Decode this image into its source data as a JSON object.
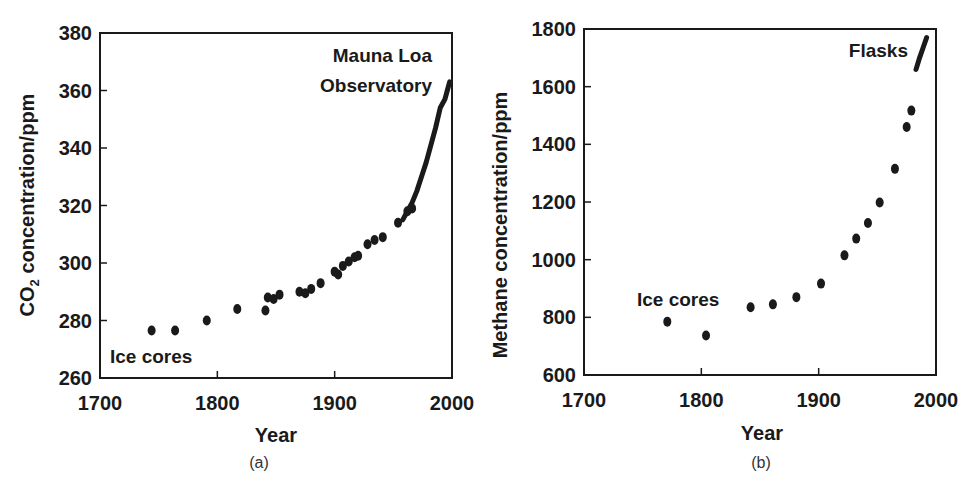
{
  "chart_data": [
    {
      "type": "scatter",
      "panel_label": "(a)",
      "title": "",
      "xlabel": "Year",
      "ylabel": "CO2 concentration/ppm",
      "xlim": [
        1700,
        2000
      ],
      "ylim": [
        260,
        380
      ],
      "xticks": [
        1700,
        1800,
        1900,
        2000
      ],
      "yticks": [
        260,
        280,
        300,
        320,
        340,
        360,
        380
      ],
      "grid": false,
      "annotations": [
        "Mauna Loa Observatory",
        "Ice cores"
      ],
      "series": [
        {
          "name": "Ice cores",
          "x": [
            1744,
            1764,
            1791,
            1817,
            1841,
            1843,
            1848,
            1853,
            1870,
            1875,
            1880,
            1888,
            1900,
            1903,
            1907,
            1912,
            1917,
            1920,
            1928,
            1934,
            1941,
            1954,
            1962,
            1966
          ],
          "y": [
            276.5,
            276.5,
            280,
            284,
            283.5,
            288,
            287.5,
            289,
            290,
            289.5,
            291,
            293,
            297,
            296,
            299,
            300.5,
            302,
            302.5,
            306.5,
            308,
            309,
            314,
            318,
            319
          ]
        },
        {
          "name": "Mauna Loa Observatory",
          "x": [
            1958,
            1962,
            1966,
            1970,
            1974,
            1978,
            1982,
            1986,
            1990,
            1994,
            1996,
            1998
          ],
          "y": [
            315,
            318,
            321,
            325,
            330,
            335,
            341,
            347,
            354,
            357,
            360,
            363
          ]
        }
      ]
    },
    {
      "type": "scatter",
      "panel_label": "(b)",
      "title": "",
      "xlabel": "Year",
      "ylabel": "Methane concentration/ppm",
      "xlim": [
        1700,
        2000
      ],
      "ylim": [
        600,
        1800
      ],
      "xticks": [
        1700,
        1800,
        1900,
        2000
      ],
      "yticks": [
        600,
        800,
        1000,
        1200,
        1400,
        1600,
        1800
      ],
      "grid": false,
      "annotations": [
        "Flasks",
        "Ice cores"
      ],
      "series": [
        {
          "name": "Ice cores",
          "x": [
            1771,
            1804,
            1842,
            1861,
            1881,
            1902,
            1922,
            1932,
            1942,
            1952,
            1965,
            1975,
            1979
          ],
          "y": [
            785,
            737,
            835,
            845,
            870,
            917,
            1015,
            1073,
            1127,
            1198,
            1315,
            1460,
            1517
          ]
        },
        {
          "name": "Flasks",
          "x": [
            1983,
            1986,
            1989,
            1992
          ],
          "y": [
            1660,
            1700,
            1735,
            1770
          ]
        }
      ]
    }
  ],
  "captions": {
    "a": "(a)",
    "b": "(b)"
  },
  "labels": {
    "a": {
      "ylabel_main": "CO",
      "ylabel_sub": "2",
      "ylabel_rest": " concentration/ppm",
      "xlabel": "Year",
      "anno1a": "Mauna Loa",
      "anno1b": "Observatory",
      "anno2": "Ice cores"
    },
    "b": {
      "ylabel": "Methane concentration/ppm",
      "xlabel": "Year",
      "anno1": "Flasks",
      "anno2": "Ice cores"
    }
  },
  "colors": {
    "ink": "#1a1a1a",
    "background": "#ffffff"
  }
}
